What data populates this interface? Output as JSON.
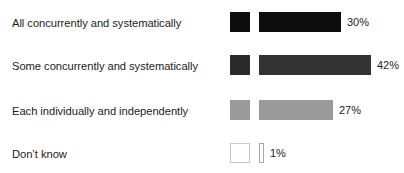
{
  "chart_data": {
    "type": "bar",
    "orientation": "horizontal",
    "title": "",
    "xlabel": "",
    "ylabel": "",
    "grid": false,
    "legend": "none",
    "xlim": [
      0,
      42
    ],
    "categories": [
      "All concurrently and systematically",
      "Some concurrently and systematically",
      "Each individually and independently",
      "Don’t know"
    ],
    "values": [
      30,
      42,
      27,
      1
    ],
    "value_labels": [
      "30%",
      "42%",
      "27%",
      "1%"
    ],
    "colors": [
      "#0d0d0d",
      "#333333",
      "#9a9a9a",
      "#ffffff"
    ],
    "swatch_colors": [
      "#0d0d0d",
      "#2b2b2b",
      "#9a9a9a",
      "#ffffff"
    ],
    "bar_border_colors": [
      "#0d0d0d",
      "#333333",
      "#9a9a9a",
      "#a8a8a8"
    ],
    "swatch_border_colors": [
      "#0d0d0d",
      "#2b2b2b",
      "#9a9a9a",
      "#c9c9c9"
    ]
  },
  "rows": [
    {
      "label": "All concurrently and systematically",
      "value_label": "30%",
      "bar_width_px": 82,
      "fill": "#0d0d0d",
      "border": "#0d0d0d",
      "swatch_fill": "#0d0d0d",
      "swatch_border": "#0d0d0d",
      "top_px": 0
    },
    {
      "label": "Some concurrently and systematically",
      "value_label": "42%",
      "bar_width_px": 112,
      "fill": "#333333",
      "border": "#333333",
      "swatch_fill": "#2b2b2b",
      "swatch_border": "#2b2b2b",
      "top_px": 43
    },
    {
      "label": "Each individually and independently",
      "value_label": "27%",
      "bar_width_px": 74,
      "fill": "#9a9a9a",
      "border": "#9a9a9a",
      "swatch_fill": "#9a9a9a",
      "swatch_border": "#9a9a9a",
      "top_px": 88
    },
    {
      "label": "Don’t know",
      "value_label": "1%",
      "bar_width_px": 5,
      "fill": "#ffffff",
      "border": "#a8a8a8",
      "swatch_fill": "#ffffff",
      "swatch_border": "#c9c9c9",
      "top_px": 131
    }
  ]
}
